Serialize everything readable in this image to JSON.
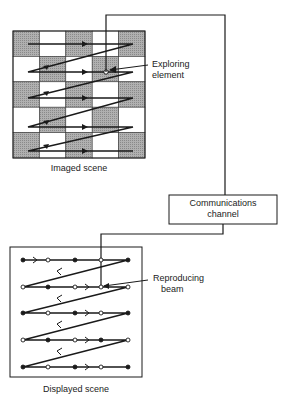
{
  "diagram": {
    "imaged_scene": {
      "caption": "Imaged scene",
      "grid": {
        "rows": 5,
        "cols": 5,
        "pattern": [
          [
            "dark",
            "light",
            "dark",
            "light",
            "dark"
          ],
          [
            "light",
            "dark",
            "light",
            "dark",
            "light"
          ],
          [
            "dark",
            "light",
            "dark",
            "light",
            "dark"
          ],
          [
            "light",
            "dark",
            "light",
            "dark",
            "light"
          ],
          [
            "dark",
            "light",
            "dark",
            "light",
            "dark"
          ]
        ]
      },
      "scan_lines": 5,
      "pointer_label": "Exploring element"
    },
    "communications_channel": {
      "label_line1": "Communications",
      "label_line2": "channel"
    },
    "displayed_scene": {
      "caption": "Displayed scene",
      "scan_lines": 5,
      "dots": [
        [
          "filled",
          "filled",
          "open",
          "filled",
          "open",
          "filled"
        ],
        [
          "open",
          "filled",
          "open",
          "open",
          "open"
        ],
        [
          "filled",
          "open",
          "filled",
          "open",
          "filled"
        ],
        [
          "open",
          "filled",
          "open",
          "filled",
          "open"
        ],
        [
          "filled",
          "open",
          "filled",
          "open",
          "filled"
        ]
      ],
      "pointer_label_line1": "Reproducing",
      "pointer_label_line2": "beam"
    },
    "colors": {
      "dark_cell": "#a8a8a8",
      "light_cell": "#ffffff",
      "line": "#1a1a1a"
    }
  }
}
